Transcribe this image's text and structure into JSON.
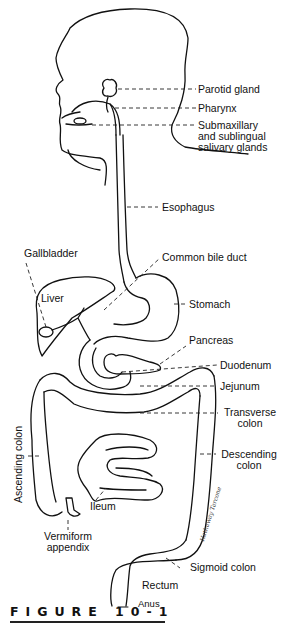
{
  "figure": {
    "caption": "FIGURE 10-1",
    "signature": "Hathaway Tarcone",
    "labels": {
      "parotid_gland": "Parotid gland",
      "pharynx": "Pharynx",
      "submaxillary_1": "Submaxillary",
      "submaxillary_2": "and sublingual",
      "submaxillary_3": "salivary glands",
      "esophagus": "Esophagus",
      "gallbladder": "Gallbladder",
      "common_bile_duct": "Common bile duct",
      "liver": "Liver",
      "stomach": "Stomach",
      "pancreas": "Pancreas",
      "duodenum": "Duodenum",
      "jejunum": "Jejunum",
      "transverse_1": "Transverse",
      "transverse_2": "colon",
      "ascending_colon": "Ascending colon",
      "descending_1": "Descending",
      "descending_2": "colon",
      "ileum": "Ileum",
      "vermiform_1": "Vermiform",
      "vermiform_2": "appendix",
      "sigmoid_colon": "Sigmoid colon",
      "rectum": "Rectum",
      "anus": "Anus"
    }
  }
}
